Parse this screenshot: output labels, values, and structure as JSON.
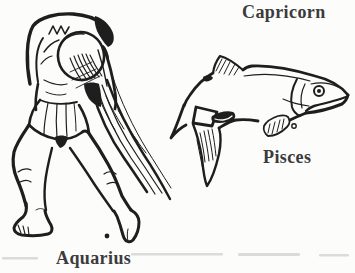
{
  "page": {
    "type": "book-illustration-scan",
    "background": "#fcfcfb",
    "ink_color": "#1e1e1e",
    "label_color": "#3b3b3b"
  },
  "labels": {
    "capricorn": "Capricorn",
    "pisces": "Pisces",
    "aquarius": "Aquarius"
  },
  "illustrations": {
    "aquarius": "aquarius-water-bearer-line-drawing",
    "pisces": "pisces-fish-line-drawing"
  }
}
